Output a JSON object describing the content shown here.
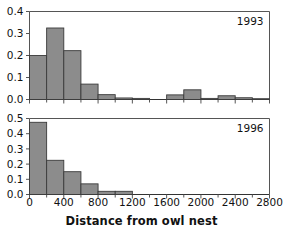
{
  "figure": {
    "background_color": "#ffffff",
    "bar_fill_color": "#8c8c8c",
    "bar_edge_color": "#3a3a3a",
    "axis_color": "#555555",
    "text_color": "#111111",
    "xaxis_title": "Distance from owl nest"
  },
  "chart_data": [
    {
      "type": "bar",
      "title": "1993",
      "panel_label": "1993",
      "xlabel": "Distance from owl nest",
      "ylabel": "",
      "xlim": [
        0,
        2800
      ],
      "ylim": [
        0.0,
        0.4
      ],
      "bin_width": 200,
      "grid": false,
      "legend": "none",
      "xticks": [
        0,
        400,
        800,
        1200,
        1600,
        2000,
        2400,
        2800
      ],
      "xtick_labels": [
        "0",
        "400",
        "800",
        "1200",
        "1600",
        "2000",
        "2400",
        "2800"
      ],
      "yticks": [
        0.0,
        0.1,
        0.2,
        0.3,
        0.4
      ],
      "ytick_labels": [
        "0.0",
        "0.1",
        "0.2",
        "0.3",
        "0.4"
      ],
      "minor_xticks_interval": 200,
      "bin_starts": [
        0,
        200,
        400,
        600,
        800,
        1000,
        1200,
        1600,
        1800,
        2000,
        2200,
        2400,
        2600
      ],
      "categories": [
        "0-200",
        "200-400",
        "400-600",
        "600-800",
        "800-1000",
        "1000-1200",
        "1200-1400",
        "1600-1800",
        "1800-2000",
        "2000-2200",
        "2200-2400",
        "2400-2600",
        "2600-2800"
      ],
      "values": [
        0.2,
        0.325,
        0.222,
        0.07,
        0.022,
        0.007,
        0.005,
        0.021,
        0.044,
        0.005,
        0.017,
        0.008,
        0.003
      ]
    },
    {
      "type": "bar",
      "title": "1996",
      "panel_label": "1996",
      "xlabel": "Distance from owl nest",
      "ylabel": "",
      "xlim": [
        0,
        2800
      ],
      "ylim": [
        0.0,
        0.5
      ],
      "bin_width": 200,
      "grid": false,
      "legend": "none",
      "xticks": [
        0,
        400,
        800,
        1200,
        1600,
        2000,
        2400,
        2800
      ],
      "xtick_labels": [
        "0",
        "400",
        "800",
        "1200",
        "1600",
        "2000",
        "2400",
        "2800"
      ],
      "yticks": [
        0.0,
        0.1,
        0.2,
        0.3,
        0.4,
        0.5
      ],
      "ytick_labels": [
        "0.0",
        "0.1",
        "0.2",
        "0.3",
        "0.4",
        "0.5"
      ],
      "minor_xticks_interval": 200,
      "bin_starts": [
        0,
        200,
        400,
        600,
        800,
        1000
      ],
      "categories": [
        "0-200",
        "200-400",
        "400-600",
        "600-800",
        "800-1000",
        "1000-1200"
      ],
      "values": [
        0.475,
        0.225,
        0.15,
        0.07,
        0.021,
        0.021
      ]
    }
  ],
  "xtick_positions": [
    {
      "label": "0",
      "value": 0
    },
    {
      "label": "400",
      "value": 400
    },
    {
      "label": "800",
      "value": 800
    },
    {
      "label": "1200",
      "value": 1200
    },
    {
      "label": "1600",
      "value": 1600
    },
    {
      "label": "2000",
      "value": 2000
    },
    {
      "label": "2400",
      "value": 2400
    },
    {
      "label": "2800",
      "value": 2800
    }
  ]
}
